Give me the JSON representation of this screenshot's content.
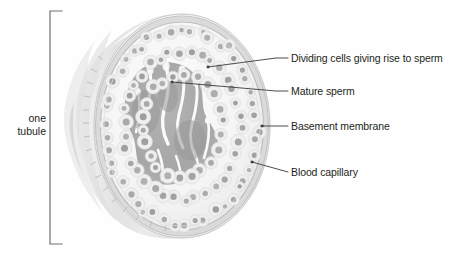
{
  "figure": {
    "kind": "biology-diagram",
    "background_color": "#fefefe",
    "ink_color": "#231f20",
    "leader_line_color": "#3a3a3a"
  },
  "bracket": {
    "label_line1": "one",
    "label_line2": "tubule",
    "color": "#6f6f6f"
  },
  "callouts": [
    {
      "id": "dividing-cells",
      "text": "Dividing cells giving rise to sperm",
      "text_x": 291,
      "text_y": 53,
      "leader": {
        "x1": 276,
        "y1": 58,
        "x2": 288,
        "y2": 58,
        "tail_x": 208,
        "tail_y": 67
      }
    },
    {
      "id": "mature-sperm",
      "text": "Mature sperm",
      "text_x": 291,
      "text_y": 86,
      "leader": {
        "x1": 276,
        "y1": 91,
        "x2": 288,
        "y2": 91,
        "tail_x": 172,
        "tail_y": 82
      }
    },
    {
      "id": "basement-membrane",
      "text": "Basement membrane",
      "text_x": 291,
      "text_y": 121,
      "leader": {
        "x1": 262,
        "y1": 126,
        "x2": 288,
        "y2": 126,
        "tail_x": 262,
        "tail_y": 126
      }
    },
    {
      "id": "blood-capillary",
      "text": "Blood capillary",
      "text_x": 291,
      "text_y": 167,
      "leader": {
        "x1": 252,
        "y1": 162,
        "x2": 288,
        "y2": 172,
        "tail_x": 252,
        "tail_y": 162
      }
    }
  ],
  "palette": {
    "tubule_body_light": "#f3f3f3",
    "tubule_body_mid": "#e2e2e2",
    "tubule_body_shadow": "#d2d2d2",
    "section_face": "#f7f7f7",
    "membrane_ring": "#cfcfcf",
    "cell_body": "#efefef",
    "nucleus": "#9a9a9a",
    "lumen_dark": "#a8a8a8",
    "sperm_white": "#fbfbfb"
  },
  "chart_data": {
    "type": "scatter",
    "cell_rings": [
      {
        "name": "outer ring of dividing cells",
        "count": 46,
        "radius_fraction": 0.86,
        "nucleus_radius": 2.6
      },
      {
        "name": "middle ring of dividing cells",
        "count": 34,
        "radius_fraction": 0.66,
        "nucleus_radius": 2.8
      },
      {
        "name": "inner ring of maturing cells",
        "count": 22,
        "radius_fraction": 0.46,
        "nucleus_radius": 3.0
      }
    ],
    "center": {
      "cx": 182,
      "cy": 126
    },
    "radius": {
      "rx": 88,
      "ry": 112
    }
  }
}
